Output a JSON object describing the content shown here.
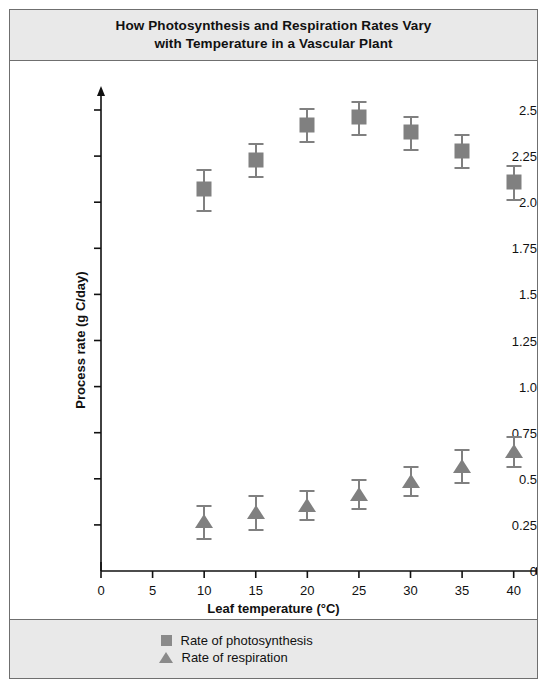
{
  "header": {
    "title_line1": "How Photosynthesis and Respiration Rates Vary",
    "title_line2": "with Temperature in a Vascular Plant"
  },
  "legend": {
    "items": [
      {
        "marker": "square-marker-icon",
        "label": "Rate of photosynthesis",
        "color": "#808080"
      },
      {
        "marker": "triangle-marker-icon",
        "label": "Rate of respiration",
        "color": "#808080"
      }
    ]
  },
  "chart_data": {
    "type": "scatter",
    "title": "How Photosynthesis and Respiration Rates Vary with Temperature in a Vascular Plant",
    "xlabel": "Leaf temperature (°C)",
    "ylabel": "Process rate (g C/day)",
    "xlim": [
      0,
      41
    ],
    "ylim": [
      0,
      2.6
    ],
    "xticks": [
      0,
      5,
      10,
      15,
      20,
      25,
      30,
      35,
      40
    ],
    "xtick_labels": [
      "0",
      "5",
      "10",
      "15",
      "20",
      "25",
      "30",
      "35",
      "40"
    ],
    "yticks": [
      0,
      0.25,
      0.5,
      0.75,
      1.0,
      1.25,
      1.5,
      1.75,
      2.0,
      2.25,
      2.5
    ],
    "ytick_labels": [
      "0",
      "0.25",
      "0.5",
      "0.75",
      "1.0",
      "1.25",
      "1.5",
      "1.75",
      "2.0",
      "2.25",
      "2.5"
    ],
    "grid": false,
    "legend_position": "bottom",
    "x": [
      10,
      15,
      20,
      25,
      30,
      35,
      40
    ],
    "series": [
      {
        "name": "Rate of photosynthesis",
        "marker": "square",
        "color": "#808080",
        "values": [
          2.07,
          2.23,
          2.42,
          2.46,
          2.38,
          2.28,
          2.11
        ],
        "errors": [
          0.11,
          0.09,
          0.09,
          0.09,
          0.09,
          0.09,
          0.09
        ]
      },
      {
        "name": "Rate of respiration",
        "marker": "triangle",
        "color": "#808080",
        "values": [
          0.27,
          0.32,
          0.36,
          0.42,
          0.49,
          0.57,
          0.65
        ],
        "errors": [
          0.09,
          0.09,
          0.08,
          0.08,
          0.08,
          0.09,
          0.08
        ]
      }
    ]
  }
}
